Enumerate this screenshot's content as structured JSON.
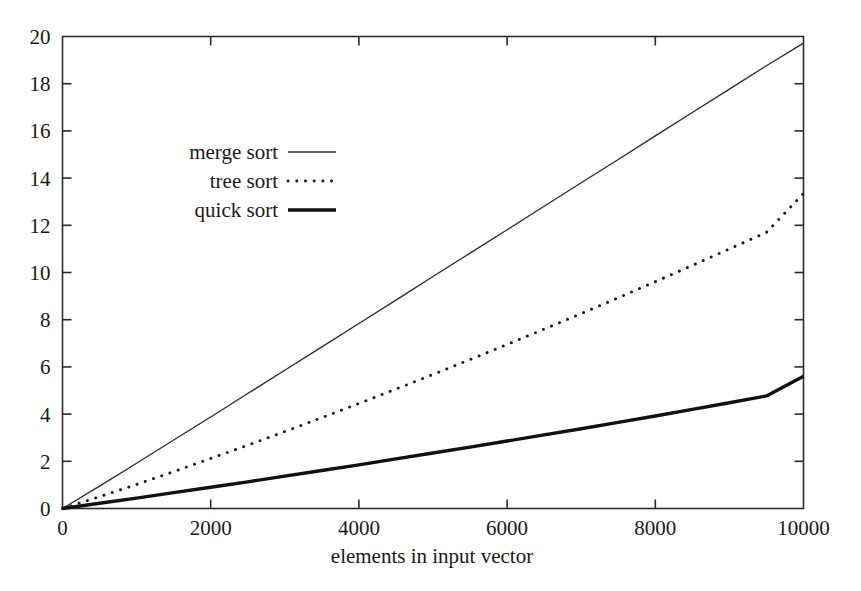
{
  "chart_data": {
    "type": "line",
    "title": "",
    "subtitle": "",
    "xlabel": "elements in input vector",
    "ylabel": "",
    "xlim": [
      0,
      10000
    ],
    "ylim": [
      0,
      20
    ],
    "xticks": [
      0,
      2000,
      4000,
      6000,
      8000,
      10000
    ],
    "xtick_labels": [
      "0",
      "2000",
      "4000",
      "6000",
      "8000",
      "10000"
    ],
    "yticks": [
      0,
      2,
      4,
      6,
      8,
      10,
      12,
      14,
      16,
      18,
      20
    ],
    "ytick_labels": [
      "0",
      "2",
      "4",
      "6",
      "8",
      "10",
      "12",
      "14",
      "16",
      "18",
      "20"
    ],
    "grid": false,
    "legend_position": "upper-left-inside",
    "frame": "box",
    "tick_direction": "in",
    "x": [
      0,
      500,
      1000,
      1500,
      2000,
      2500,
      3000,
      3500,
      4000,
      4500,
      5000,
      5500,
      6000,
      6500,
      7000,
      7500,
      8000,
      8500,
      9000,
      9500,
      10000
    ],
    "series": [
      {
        "name": "merge sort",
        "style": "solid-thin",
        "color": "#2b2b2b",
        "linewidth": 1.3,
        "values": [
          0.0,
          0.95,
          1.92,
          2.9,
          3.88,
          4.87,
          5.86,
          6.85,
          7.84,
          8.83,
          9.83,
          10.82,
          11.81,
          12.81,
          13.8,
          14.79,
          15.79,
          16.78,
          17.77,
          18.76,
          19.72
        ]
      },
      {
        "name": "tree sort",
        "style": "dotted",
        "color": "#1a1a1a",
        "linewidth": 2.6,
        "values": [
          0.0,
          0.5,
          1.02,
          1.56,
          2.12,
          2.68,
          3.26,
          3.85,
          4.45,
          5.06,
          5.68,
          6.31,
          6.95,
          7.6,
          8.26,
          8.93,
          9.61,
          10.3,
          11.0,
          11.7,
          13.35
        ]
      },
      {
        "name": "quick sort",
        "style": "solid-thick",
        "color": "#111111",
        "linewidth": 3.4,
        "values": [
          0.0,
          0.22,
          0.44,
          0.67,
          0.9,
          1.13,
          1.37,
          1.61,
          1.85,
          2.1,
          2.35,
          2.6,
          2.86,
          3.12,
          3.38,
          3.65,
          3.92,
          4.2,
          4.48,
          4.77,
          5.6
        ]
      }
    ],
    "legend_entries": [
      {
        "label": "merge sort",
        "style": "solid-thin"
      },
      {
        "label": "tree sort",
        "style": "dotted"
      },
      {
        "label": "quick sort",
        "style": "solid-thick"
      }
    ]
  },
  "colors": {
    "background": "#ffffff",
    "axis": "#2b2b2b",
    "text": "#1a1a1a"
  }
}
